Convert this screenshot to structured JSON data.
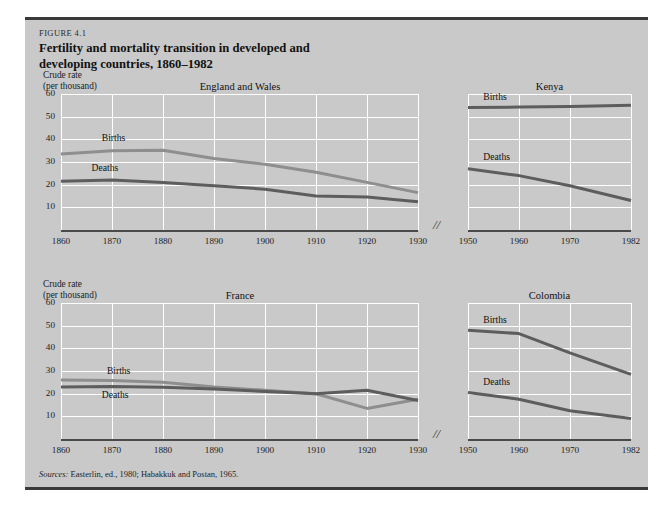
{
  "figure": {
    "label": "FIGURE 4.1",
    "sources_prefix": "Sources:",
    "sources_text": " Easterlin, ed., 1980; Habakkuk and Postan, 1965."
  },
  "axis_caption": {
    "line1": "Crude rate",
    "line2": "(per thousand)"
  },
  "colors": {
    "figure_background": "#c9c9c9",
    "gridline": "#ffffff",
    "axis": "#4a4a4a",
    "births_line": "#8e8e8e",
    "deaths_line": "#5d5d5d",
    "text": "#1c1c1c"
  },
  "axis_break_symbol": "//",
  "y_ticks": [
    10,
    20,
    30,
    40,
    50,
    60
  ],
  "chart_data": [
    {
      "type": "line",
      "title": "England and Wales",
      "xlabel": "",
      "ylabel": "Crude rate (per thousand)",
      "ylim": [
        0,
        60
      ],
      "xlim": [
        1860,
        1930
      ],
      "grid": true,
      "legend": "inline-labels",
      "x_ticks": [
        1860,
        1870,
        1880,
        1890,
        1900,
        1910,
        1920,
        1930
      ],
      "x": [
        1860,
        1870,
        1880,
        1890,
        1900,
        1910,
        1920,
        1930
      ],
      "series": [
        {
          "name": "Births",
          "values": [
            33.5,
            35.0,
            35.2,
            31.5,
            29.0,
            25.5,
            21.0,
            16.5
          ]
        },
        {
          "name": "Deaths",
          "values": [
            21.5,
            22.0,
            21.0,
            19.5,
            18.0,
            15.0,
            14.5,
            12.5
          ]
        }
      ]
    },
    {
      "type": "line",
      "title": "Kenya",
      "xlabel": "",
      "ylabel": "",
      "ylim": [
        0,
        60
      ],
      "xlim": [
        1950,
        1982
      ],
      "grid": true,
      "legend": "inline-labels",
      "x_ticks": [
        1950,
        1960,
        1970,
        1982
      ],
      "x": [
        1950,
        1960,
        1970,
        1982
      ],
      "series": [
        {
          "name": "Births",
          "values": [
            54.0,
            54.2,
            54.5,
            55.0
          ]
        },
        {
          "name": "Deaths",
          "values": [
            27.0,
            24.0,
            19.5,
            13.0
          ]
        }
      ]
    },
    {
      "type": "line",
      "title": "France",
      "xlabel": "",
      "ylabel": "Crude rate (per thousand)",
      "ylim": [
        0,
        60
      ],
      "xlim": [
        1860,
        1930
      ],
      "grid": true,
      "legend": "inline-labels",
      "x_ticks": [
        1860,
        1870,
        1880,
        1890,
        1900,
        1910,
        1920,
        1930
      ],
      "x": [
        1860,
        1870,
        1880,
        1890,
        1900,
        1910,
        1920,
        1930
      ],
      "series": [
        {
          "name": "Births",
          "values": [
            26.0,
            25.8,
            25.0,
            23.0,
            21.5,
            20.0,
            13.5,
            17.5
          ]
        },
        {
          "name": "Deaths",
          "values": [
            23.0,
            23.2,
            22.8,
            22.0,
            21.0,
            20.0,
            21.5,
            17.0
          ]
        }
      ]
    },
    {
      "type": "line",
      "title": "Colombia",
      "xlabel": "",
      "ylabel": "",
      "ylim": [
        0,
        60
      ],
      "xlim": [
        1950,
        1982
      ],
      "grid": true,
      "legend": "inline-labels",
      "x_ticks": [
        1950,
        1960,
        1970,
        1982
      ],
      "x": [
        1950,
        1960,
        1970,
        1982
      ],
      "series": [
        {
          "name": "Births",
          "values": [
            48.0,
            46.5,
            38.0,
            28.5
          ]
        },
        {
          "name": "Deaths",
          "values": [
            20.5,
            17.5,
            12.5,
            9.0
          ]
        }
      ]
    }
  ]
}
